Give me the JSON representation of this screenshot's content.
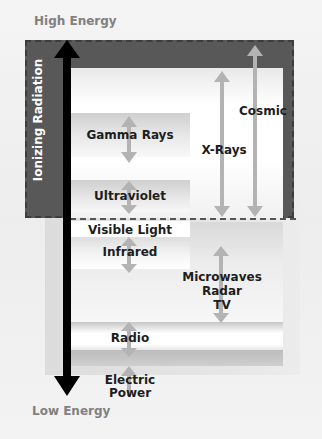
{
  "top_label": "High Energy",
  "bottom_label": "Low Energy",
  "ionizing_label": "Ionizing Radiation",
  "bands": {
    "gamma": "Gamma Rays",
    "xrays": "X-Rays",
    "cosmic": "Cosmic",
    "ultraviolet": "Ultraviolet",
    "visible": "Visible Light",
    "infrared": "Infrared",
    "microwaves": [
      "Microwaves",
      "Radar",
      "TV"
    ],
    "radio": "Radio",
    "electric": [
      "Electric",
      "Power"
    ]
  },
  "colors": {
    "ionizing_region": "#585858",
    "main_arrow": "#000000",
    "range_arrow": "#b3b3b3",
    "text": "#1d1d1d",
    "energy_text": "#808080"
  }
}
